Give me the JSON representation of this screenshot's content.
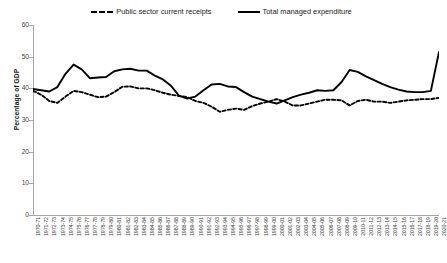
{
  "chart_data": {
    "type": "line",
    "title": "",
    "xlabel": "",
    "ylabel": "Percentage of GDP",
    "ylim": [
      0,
      60
    ],
    "yticks": [
      0,
      10,
      20,
      30,
      40,
      50,
      60
    ],
    "grid": false,
    "legend_position": "top-center",
    "categories": [
      "1970-71",
      "1971-72",
      "1972-73",
      "1973-74",
      "1974-75",
      "1975-76",
      "1976-77",
      "1977-78",
      "1978-79",
      "1979-80",
      "1980-81",
      "1981-82",
      "1982-83",
      "1983-84",
      "1984-85",
      "1985-86",
      "1986-87",
      "1987-88",
      "1988-89",
      "1989-90",
      "1990-91",
      "1991-92",
      "1992-93",
      "1993-94",
      "1994-95",
      "1995-96",
      "1996-97",
      "1997-98",
      "1998-99",
      "1999-00",
      "2000-01",
      "2001-02",
      "2002-03",
      "2003-04",
      "2004-05",
      "2005-06",
      "2006-07",
      "2007-08",
      "2008-09",
      "2009-10",
      "2010-11",
      "2011-12",
      "2012-13",
      "2013-14",
      "2014-15",
      "2015-16",
      "2016-17",
      "2017-18",
      "2018-19",
      "2019-20",
      "2020-21"
    ],
    "series": [
      {
        "name": "Public sector current receipts",
        "style": "dashed",
        "color": "#000000",
        "values": [
          39.2,
          38.0,
          36.0,
          35.4,
          37.4,
          39.2,
          38.8,
          38.0,
          37.2,
          37.4,
          38.8,
          40.5,
          40.6,
          40.0,
          40.0,
          39.4,
          38.6,
          38.0,
          37.6,
          37.2,
          36.0,
          35.4,
          34.2,
          32.6,
          33.2,
          33.6,
          33.2,
          34.4,
          35.2,
          35.8,
          36.6,
          35.8,
          34.6,
          34.6,
          35.2,
          35.8,
          36.4,
          36.4,
          36.2,
          34.6,
          36.0,
          36.4,
          35.8,
          35.8,
          35.4,
          35.8,
          36.2,
          36.4,
          36.6,
          36.6,
          37.0
        ]
      },
      {
        "name": "Total managed expenditure",
        "style": "solid",
        "color": "#000000",
        "values": [
          39.8,
          39.4,
          39.0,
          40.4,
          44.6,
          47.5,
          46.0,
          43.2,
          43.4,
          43.6,
          45.4,
          46.0,
          46.2,
          45.6,
          45.6,
          44.0,
          42.8,
          40.8,
          37.6,
          36.8,
          37.4,
          39.4,
          41.2,
          41.4,
          40.6,
          40.4,
          38.8,
          37.4,
          36.6,
          35.8,
          35.2,
          36.2,
          37.2,
          38.0,
          38.6,
          39.4,
          39.2,
          39.4,
          42.0,
          45.8,
          45.2,
          43.8,
          42.6,
          41.4,
          40.4,
          39.6,
          39.0,
          38.8,
          38.8,
          39.2,
          51.5
        ]
      }
    ]
  },
  "legend": {
    "items": [
      {
        "label": "Public sector current receipts",
        "style": "dashed"
      },
      {
        "label": "Total managed expenditure",
        "style": "solid"
      }
    ]
  },
  "axes": {
    "y_title": "Percentage of GDP"
  }
}
